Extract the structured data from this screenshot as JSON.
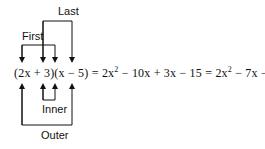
{
  "diagram": {
    "labels": {
      "first": "First",
      "last": "Last",
      "inner": "Inner",
      "outer": "Outer"
    },
    "equation": {
      "lhs": "(2x + 3)(x − 5)",
      "eq1": " = 2x",
      "sup1": "2",
      "mid": " − 10x + 3x − 15 = 2x",
      "sup2": "2",
      "rhs": " − 7x − 15"
    },
    "colors": {
      "line": "#111111",
      "text": "#111111",
      "background": "#ffffff"
    }
  }
}
